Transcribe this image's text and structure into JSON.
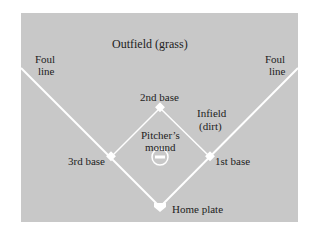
{
  "colors": {
    "grass": "#c8c8c8",
    "dirt": "#a9a9a9",
    "lines": "#ffffff",
    "text": "#222222"
  },
  "labels": {
    "outfield": "Outfield (grass)",
    "foul_left_1": "Foul",
    "foul_left_2": "line",
    "foul_right_1": "Foul",
    "foul_right_2": "line",
    "second_base": "2nd base",
    "infield_1": "Infield",
    "infield_2": "(dirt)",
    "mound_1": "Pitcher’s",
    "mound_2": "mound",
    "third_base": "3rd base",
    "first_base": "1st base",
    "home_plate": "Home plate"
  }
}
